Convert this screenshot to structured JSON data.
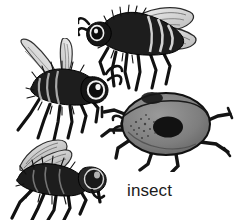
{
  "plate": {
    "width": 234,
    "height": 220,
    "background_color": "#ffffff",
    "caption": "insect",
    "caption_color": "#1b1b1b",
    "style": "black-and-white ink engraving illustration",
    "ink_color": "#1a1a1a",
    "mid_gray": "#808080",
    "light_gray": "#c9c9c9"
  },
  "figures": [
    {
      "id": "bee-top",
      "name": "bee-upper-right",
      "label": "bee",
      "position": {
        "x": 78,
        "y": 2
      },
      "size": {
        "width": 120,
        "height": 95
      },
      "facing": "left",
      "parts": [
        "antenna",
        "head",
        "eye",
        "thorax",
        "striped-abdomen",
        "two-wings",
        "six-legs"
      ],
      "body_color": "#1a1a1a",
      "wing_color": "#d7d7d7"
    },
    {
      "id": "bee-left",
      "name": "bee-middle-left",
      "label": "bee",
      "position": {
        "x": 14,
        "y": 38
      },
      "size": {
        "width": 108,
        "height": 102
      },
      "facing": "right",
      "parts": [
        "antenna",
        "head",
        "eye",
        "furry-thorax",
        "abdomen",
        "two-wings",
        "six-legs"
      ],
      "body_color": "#1a1a1a",
      "wing_color": "#d7d7d7"
    },
    {
      "id": "ladybug",
      "name": "ladybug-beetle",
      "label": "ladybug",
      "position": {
        "x": 100,
        "y": 86
      },
      "size": {
        "width": 134,
        "height": 84
      },
      "facing": "left",
      "parts": [
        "head",
        "oval-elytra",
        "center-spot",
        "upper-spot",
        "six-legs"
      ],
      "body_color": "#7f7f7f",
      "spot_color": "#151515",
      "outline_color": "#1a1a1a"
    },
    {
      "id": "fly",
      "name": "fly-bottom-left",
      "label": "fly",
      "position": {
        "x": 0,
        "y": 136
      },
      "size": {
        "width": 118,
        "height": 84
      },
      "facing": "right",
      "parts": [
        "head",
        "compound-eye",
        "bristly-thorax",
        "abdomen",
        "two-veined-wings",
        "six-legs"
      ],
      "body_color": "#1a1a1a",
      "wing_color": "#cfcfcf"
    }
  ]
}
